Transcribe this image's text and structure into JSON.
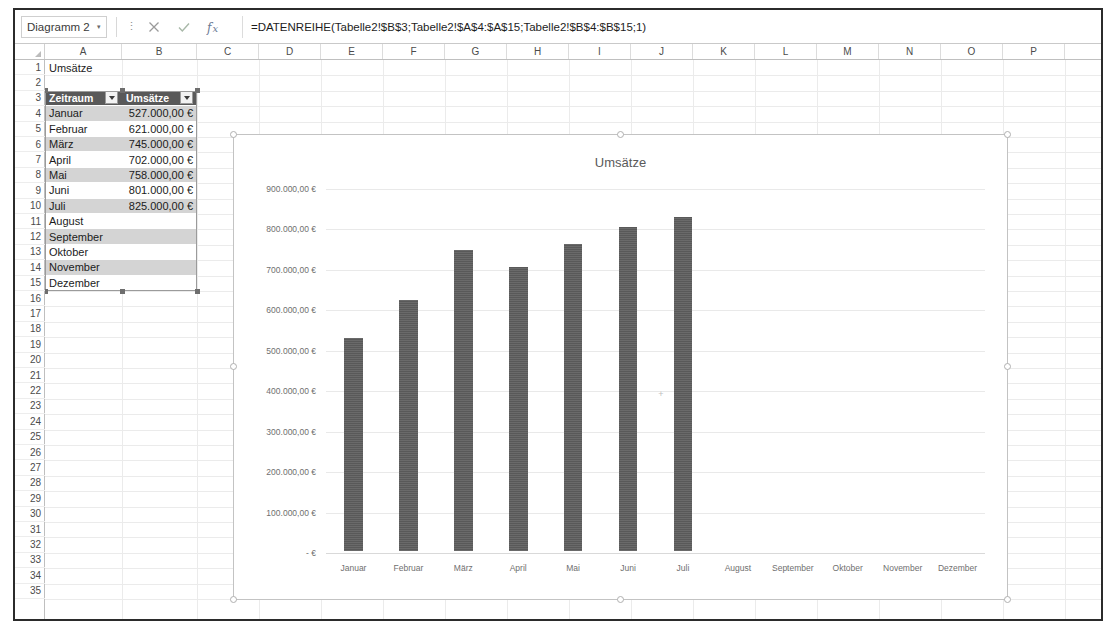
{
  "app": {
    "name_box_value": "Diagramm 2",
    "name_box_caret": "▾",
    "formula_dots": "⋮",
    "formula_value": "=DATENREIHE(Tabelle2!$B$3;Tabelle2!$A$4:$A$15;Tabelle2!$B$4:$B$15;1)",
    "icons": {
      "cancel": "cancel-icon",
      "confirm": "confirm-icon",
      "function": "fx-icon"
    }
  },
  "grid": {
    "column_headers": [
      "A",
      "B",
      "C",
      "D",
      "E",
      "F",
      "G",
      "H",
      "I",
      "J",
      "K",
      "L",
      "M",
      "N",
      "O",
      "P"
    ],
    "row_headers": [
      "1",
      "2",
      "3",
      "4",
      "5",
      "6",
      "7",
      "8",
      "9",
      "10",
      "11",
      "12",
      "13",
      "14",
      "15",
      "16",
      "17",
      "18",
      "19",
      "20",
      "21",
      "22",
      "23",
      "24",
      "25",
      "26",
      "27",
      "28",
      "29",
      "30",
      "31",
      "32",
      "33",
      "34",
      "35"
    ]
  },
  "cells": {
    "a1": "Umsätze"
  },
  "table": {
    "headers": [
      "Zeitraum",
      "Umsätze"
    ],
    "rows": [
      {
        "row": "4",
        "zeitraum": "Januar",
        "umsatz": "527.000,00 €"
      },
      {
        "row": "5",
        "zeitraum": "Februar",
        "umsatz": "621.000,00 €"
      },
      {
        "row": "6",
        "zeitraum": "März",
        "umsatz": "745.000,00 €"
      },
      {
        "row": "7",
        "zeitraum": "April",
        "umsatz": "702.000,00 €"
      },
      {
        "row": "8",
        "zeitraum": "Mai",
        "umsatz": "758.000,00 €"
      },
      {
        "row": "9",
        "zeitraum": "Juni",
        "umsatz": "801.000,00 €"
      },
      {
        "row": "10",
        "zeitraum": "Juli",
        "umsatz": "825.000,00 €"
      },
      {
        "row": "11",
        "zeitraum": "August",
        "umsatz": ""
      },
      {
        "row": "12",
        "zeitraum": "September",
        "umsatz": ""
      },
      {
        "row": "13",
        "zeitraum": "Oktober",
        "umsatz": ""
      },
      {
        "row": "14",
        "zeitraum": "November",
        "umsatz": ""
      },
      {
        "row": "15",
        "zeitraum": "Dezember",
        "umsatz": ""
      }
    ]
  },
  "chart_data": {
    "type": "bar",
    "title": "Umsätze",
    "xlabel": "",
    "ylabel": "",
    "categories": [
      "Januar",
      "Februar",
      "März",
      "April",
      "Mai",
      "Juni",
      "Juli",
      "August",
      "September",
      "Oktober",
      "November",
      "Dezember"
    ],
    "values": [
      527000,
      621000,
      745000,
      702000,
      758000,
      801000,
      825000,
      null,
      null,
      null,
      null,
      null
    ],
    "series": [
      {
        "name": "Umsätze",
        "values": [
          527000,
          621000,
          745000,
          702000,
          758000,
          801000,
          825000,
          null,
          null,
          null,
          null,
          null
        ]
      }
    ],
    "ylim": [
      0,
      900000
    ],
    "ytick_values": [
      0,
      100000,
      200000,
      300000,
      400000,
      500000,
      600000,
      700000,
      800000,
      900000
    ],
    "ytick_labels": [
      "- €",
      "100.000,00 €",
      "200.000,00 €",
      "300.000,00 €",
      "400.000,00 €",
      "500.000,00 €",
      "600.000,00 €",
      "700.000,00 €",
      "800.000,00 €",
      "900.000,00 €"
    ],
    "grid": true,
    "legend": false,
    "bar_color": "#595959"
  },
  "colors": {
    "table_header_bg": "#595959",
    "table_band_bg": "#d4d4d4",
    "bar": "#595959",
    "gridline": "#e9e9e9",
    "window_border": "#2b2b2b"
  }
}
